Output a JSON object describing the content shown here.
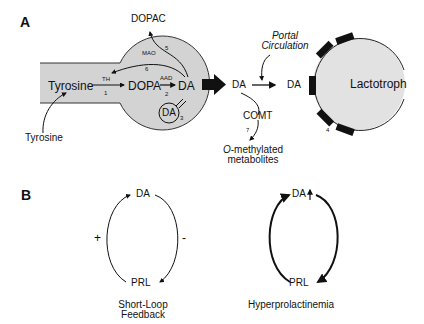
{
  "panel_a": {
    "label": "A",
    "neuron": {
      "tyrosine_inside": "Tyrosine",
      "tyrosine_outside": "Tyrosine",
      "dopa": "DOPA",
      "da": "DA",
      "vesicle_da": "DA",
      "dopac": "DOPAC",
      "enzymes": {
        "th": "TH",
        "aad": "AAD",
        "mao": "MAO"
      },
      "steps": {
        "s1": "1",
        "s2": "2",
        "s3": "3",
        "s5": "5",
        "s6": "6"
      }
    },
    "extracellular": {
      "da_released": "DA",
      "da_portal": "DA",
      "portal_circulation_line1": "Portal",
      "portal_circulation_line2": "Circulation",
      "comt": "COMT",
      "step7": "7",
      "metabolites_line1": "O-methylated",
      "metabolites_line2": "metabolites"
    },
    "lactotroph": {
      "label": "Lactotroph",
      "receptor_step": "4"
    }
  },
  "panel_b": {
    "label": "B",
    "short_loop": {
      "top": "DA",
      "bottom": "PRL",
      "plus": "+",
      "minus": "-",
      "caption_line1": "Short-Loop",
      "caption_line2": "Feedback"
    },
    "hyper": {
      "top": "DA",
      "bottom": "PRL",
      "caption": "Hyperprolactinemia"
    }
  },
  "colors": {
    "cell_fill": "#d3d3d3",
    "stroke": "#111111",
    "lactotroph_fill": "#e2e2e2"
  }
}
